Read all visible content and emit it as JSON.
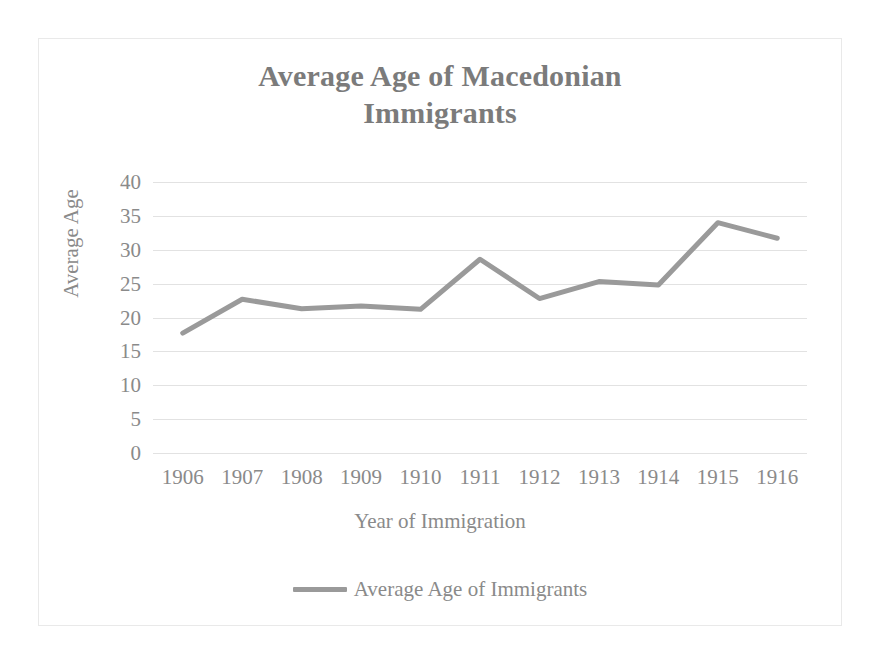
{
  "chart_data": {
    "type": "line",
    "title": "Average Age of Macedonian Immigrants",
    "title_line1": "Average Age of Macedonian",
    "title_line2": "Immigrants",
    "xlabel": "Year of Immigration",
    "ylabel": "Average Age",
    "categories": [
      "1906",
      "1907",
      "1908",
      "1909",
      "1910",
      "1911",
      "1912",
      "1913",
      "1914",
      "1915",
      "1916"
    ],
    "series": [
      {
        "name": "Average Age of Immigrants",
        "values": [
          17.7,
          22.7,
          21.3,
          21.7,
          21.2,
          28.6,
          22.8,
          25.3,
          24.8,
          34.0,
          31.7
        ]
      }
    ],
    "ylim": [
      0,
      40
    ],
    "yticks": [
      40,
      35,
      30,
      25,
      20,
      15,
      10,
      5,
      0
    ],
    "ytick_labels": [
      "40",
      "35",
      "30",
      "25",
      "20",
      "15",
      "10",
      "5",
      "0"
    ],
    "grid": true,
    "grid_axis": "y",
    "legend": {
      "position": "bottom",
      "entries": [
        {
          "label": "Average Age of Immigrants",
          "color": "#9a9a9a",
          "marker": "line-swatch"
        }
      ]
    },
    "colors": {
      "line": "#9a9a9a",
      "grid": "#e2e2e2",
      "text": "#8a8a8a",
      "title": "#7b7b7b",
      "border": "#e9e9e9",
      "background": "#ffffff"
    },
    "line_width": 5
  }
}
